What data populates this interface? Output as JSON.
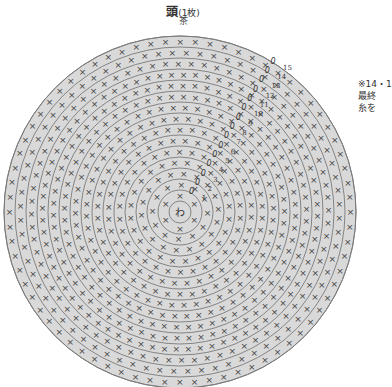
{
  "header": {
    "title": "頭",
    "title_suffix": "(1枚)",
    "color_label": "茶"
  },
  "note": {
    "lines": [
      "※14・1",
      "最終",
      "糸を"
    ]
  },
  "diagram": {
    "center": {
      "x": 180,
      "y": 212
    },
    "center_label": "わ",
    "center_ring_radius": 11,
    "round_width": 11,
    "rounds": 15,
    "fill": "#d9d9d9",
    "line_color": "#7a7a7a",
    "stitch_color": "#444444",
    "round_numbers": [
      "1",
      "2",
      "3",
      "4",
      "5",
      "6",
      "7",
      "8",
      "9",
      "10",
      "11",
      "12",
      "13",
      "14",
      "15"
    ],
    "stitches_per_round": [
      6,
      12,
      18,
      24,
      30,
      36,
      42,
      48,
      54,
      60,
      66,
      72,
      72,
      72,
      72
    ],
    "start_marker": "0",
    "stitch_symbol": "×",
    "increase_symbol": "≫"
  }
}
